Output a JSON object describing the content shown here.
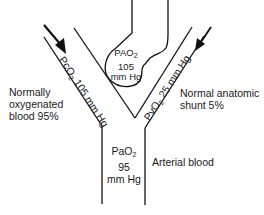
{
  "diagram": {
    "alveolus": {
      "label_line1": "PAO",
      "sub": "2",
      "label_line2": "105",
      "label_line3": "mm Hg"
    },
    "left_vessel": {
      "label_prefix": "PcO",
      "sub": "2",
      "label_suffix": " 105 mm Hg"
    },
    "right_vessel": {
      "label_prefix": "PvO",
      "sub": "2",
      "label_suffix": " 25 mm Hg"
    },
    "arterial": {
      "label_line1": "PaO",
      "sub": "2",
      "label_line2": "95",
      "label_line3": "mm Hg"
    },
    "left_caption": {
      "line1": "Normally",
      "line2": "oxygenated",
      "line3": "blood 95%"
    },
    "right_caption": {
      "line1": "Normal anatomic",
      "line2": "shunt 5%"
    },
    "bottom_caption": "Arterial blood",
    "line_color": "#111111"
  }
}
